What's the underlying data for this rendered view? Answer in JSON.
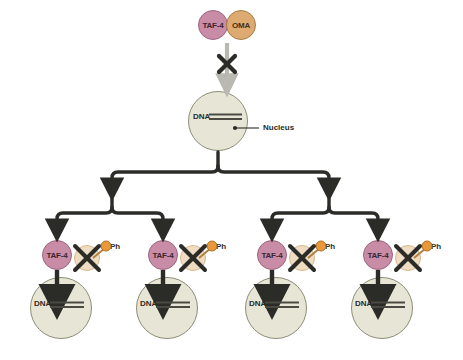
{
  "diagram": {
    "colors": {
      "taf4_fill": "#c98ca6",
      "taf4_stroke": "#9c6580",
      "oma_fill": "#ddab72",
      "oma_stroke": "#a97c45",
      "oma_inactive_fill": "#eeddc2",
      "oma_inactive_stroke": "#d8b98c",
      "nucleus_fill": "#e7e6d6",
      "nucleus_stroke": "#8d8d76",
      "phosphate_fill": "#e8993a",
      "phosphate_stroke": "#b36f1f",
      "blocked_arrow": "#b9b9b2",
      "cross_mark": "#2b2b28",
      "line": "#2b2b28",
      "dna_strand": "#4a4a42",
      "background": "#ffffff"
    }
  },
  "top_complex": {
    "taf4_label": "TAF-4",
    "oma_label": "OMA",
    "blocked_arrow_name": "blocked-nuclear-entry-arrow",
    "cross_name": "blocked-cross-mark"
  },
  "parent_nucleus": {
    "dna_label": "DNA",
    "callout_label": "Nucleus"
  },
  "lineage": {
    "levels": 2,
    "branch_description": "binary branching from parent nucleus to four daughter cells"
  },
  "daughter_cells": [
    {
      "id": "daughter-cell-1",
      "taf4_label": "TAF-4",
      "ph_label": "Ph",
      "dna_label": "DNA",
      "activation_sign": "+",
      "oma_state": "inactive-crossed-out"
    },
    {
      "id": "daughter-cell-2",
      "taf4_label": "TAF-4",
      "ph_label": "Ph",
      "dna_label": "DNA",
      "activation_sign": "+",
      "oma_state": "inactive-crossed-out"
    },
    {
      "id": "daughter-cell-3",
      "taf4_label": "TAF-4",
      "ph_label": "Ph",
      "dna_label": "DNA",
      "activation_sign": "+",
      "oma_state": "inactive-crossed-out"
    },
    {
      "id": "daughter-cell-4",
      "taf4_label": "TAF-4",
      "ph_label": "Ph",
      "dna_label": "DNA",
      "activation_sign": "+",
      "oma_state": "inactive-crossed-out"
    }
  ]
}
